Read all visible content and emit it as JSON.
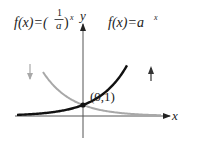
{
  "chart_data": {
    "type": "line",
    "title": "",
    "xlabel": "x",
    "ylabel": "y",
    "xlim": [
      -3.5,
      4.5
    ],
    "ylim": [
      -1.0,
      4.5
    ],
    "grid": false,
    "base_a": 2,
    "series": [
      {
        "name": "f(x)=a^x",
        "label_text": "f(x)=a",
        "label_exp": "x",
        "color": "#111111",
        "x": [
          -3.3,
          -3,
          -2.5,
          -2,
          -1.5,
          -1,
          -0.5,
          0,
          0.5,
          1,
          1.5,
          2,
          2.2
        ],
        "y": [
          0.1,
          0.125,
          0.177,
          0.25,
          0.354,
          0.5,
          0.707,
          1,
          1.414,
          2,
          2.828,
          4,
          4.59
        ]
      },
      {
        "name": "f(x)=(1/a)^x",
        "label_text": "f(x)=(",
        "label_frac_num": "1",
        "label_frac_den": "a",
        "label_close": ")",
        "label_exp": "x",
        "color": "#a8a8a8",
        "x": [
          -2.0,
          -1.5,
          -1,
          -0.5,
          0,
          0.5,
          1,
          1.5,
          2,
          2.5,
          3,
          3.5,
          3.9
        ],
        "y": [
          4.0,
          2.828,
          2,
          1.414,
          1,
          0.707,
          0.5,
          0.354,
          0.25,
          0.177,
          0.125,
          0.088,
          0.067
        ]
      }
    ],
    "annotations": [
      {
        "text": "(0,1)",
        "x": 0,
        "y": 1,
        "marker": "point"
      },
      {
        "text": "down-arrow",
        "meaning": "decreasing",
        "color": "#a8a8a8"
      },
      {
        "text": "up-arrow",
        "meaning": "increasing",
        "color": "#333333"
      }
    ]
  }
}
